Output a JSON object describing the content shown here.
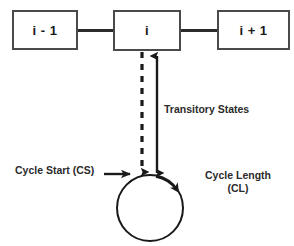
{
  "diagram": {
    "background_color": "#ffffff",
    "stroke_color": "#2b2b2b",
    "box_border_color": "#4a4a4a",
    "nodes": [
      {
        "id": "prev",
        "label": "i - 1"
      },
      {
        "id": "current",
        "label": "i"
      },
      {
        "id": "next",
        "label": "i + 1"
      }
    ],
    "annotations": {
      "transitory_states": "Transitory States",
      "cycle_start": "Cycle Start (CS)",
      "cycle_length_line1": "Cycle Length",
      "cycle_length_line2": "(CL)"
    },
    "edges": [
      {
        "from": "prev",
        "to": "current",
        "style": "solid",
        "arrow": "none"
      },
      {
        "from": "current",
        "to": "next",
        "style": "solid",
        "arrow": "none"
      },
      {
        "from": "current",
        "to": "cycle",
        "style": "dashed",
        "arrow": "down"
      },
      {
        "from": "cycle",
        "to": "current",
        "style": "solid",
        "arrow": "both"
      },
      {
        "from": "cycle_start_label",
        "to": "cycle",
        "style": "solid",
        "arrow": "end"
      }
    ],
    "cycle": {
      "shape": "circle",
      "direction": "clockwise",
      "center_x": 150,
      "center_y": 208,
      "radius": 33
    }
  }
}
